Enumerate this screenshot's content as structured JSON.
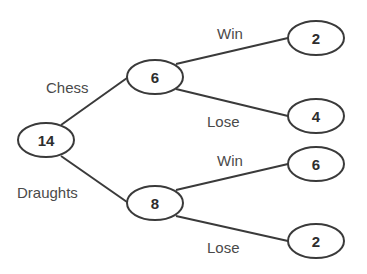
{
  "diagram": {
    "type": "tree-diagram",
    "root": {
      "value": "14"
    },
    "level1": [
      {
        "branch_label": "Chess",
        "value": "6"
      },
      {
        "branch_label": "Draughts",
        "value": "8"
      }
    ],
    "level2": [
      {
        "parent": "Chess",
        "branch_label": "Win",
        "value": "2"
      },
      {
        "parent": "Chess",
        "branch_label": "Lose",
        "value": "4"
      },
      {
        "parent": "Draughts",
        "branch_label": "Win",
        "value": "6"
      },
      {
        "parent": "Draughts",
        "branch_label": "Lose",
        "value": "2"
      }
    ]
  }
}
